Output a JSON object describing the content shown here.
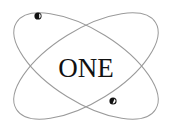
{
  "logo": {
    "text": "ONE",
    "colors": {
      "orbit": "#9a9a9a",
      "text": "#111111",
      "planet": "#111111",
      "background": "#ffffff"
    },
    "icons": [
      "orbit-ellipse-icon",
      "planet-dot-icon"
    ]
  }
}
